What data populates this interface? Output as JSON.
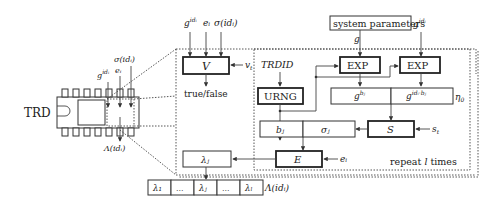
{
  "diagram": {
    "chip": {
      "label": "TRD",
      "inputs": [
        "g^{id_i}",
        "e_i",
        "σ(id_i)"
      ],
      "output": "Λ(id_i)"
    },
    "verify": {
      "box": "V",
      "inputs": [
        "g",
        "e",
        "σ(id"
      ],
      "input_sups": [
        "idᵢ",
        "ᵢ",
        "ᵢ)"
      ],
      "side_input": "v",
      "side_sub": "t",
      "output": "true/false"
    },
    "system_parameters": "system parameters",
    "g_label": "g",
    "g_id_top": "g",
    "g_id_top_sup": "idᵢ",
    "trdid": "TRDID",
    "urng": "URNG",
    "exp1": "EXP",
    "exp2": "EXP",
    "g_bj": "g",
    "g_bj_sup": "bⱼ",
    "g_idbj": "g",
    "g_idbj_sup": "idᵢ·bⱼ",
    "eta": "η",
    "eta_sub": "0",
    "sign_box": "S",
    "s_t": "s",
    "s_t_sub": "t",
    "b_j": "bⱼ",
    "sigma_j": "σⱼ",
    "enc_box": "E",
    "e_i": "eᵢ",
    "lambda_j_box": "λⱼ",
    "repeat": "repeat ",
    "repeat_l": "l",
    "repeat_end": " times",
    "output_array": [
      "λ₁",
      "...",
      "λⱼ",
      "...",
      "λₗ"
    ],
    "output_label": "Λ(idᵢ)",
    "chip_out_label": "Λ(idᵢ)",
    "chip_in_sigma": "σ(idᵢ)",
    "chip_in_e": "eᵢ",
    "chip_in_g": "g",
    "chip_in_g_sup": "idᵢ"
  }
}
